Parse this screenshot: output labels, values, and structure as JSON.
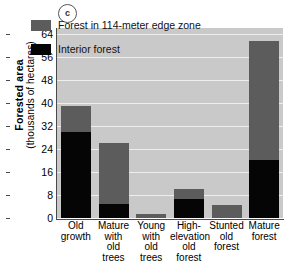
{
  "figure": {
    "panel_label": "c"
  },
  "chart_data": {
    "type": "bar",
    "title": "",
    "subtitle": "",
    "xlabel": "",
    "ylabel": "Forested area",
    "ylabel_units": "(thousands of hectares)",
    "ylim": [
      0,
      66
    ],
    "yticks": [
      0,
      8,
      16,
      24,
      32,
      40,
      48,
      56,
      64
    ],
    "ytick_labels": [
      "0",
      "8",
      "16",
      "24",
      "32",
      "40",
      "48",
      "56",
      "64"
    ],
    "grid": true,
    "grid_axis": "y",
    "stacked": true,
    "legend_position": "inside-top-left",
    "categories": [
      "Old growth",
      "Mature with old trees",
      "Young with old trees",
      "High-elevation old forest",
      "Stunted old forest",
      "Mature forest"
    ],
    "category_lines": [
      [
        "Old",
        "growth"
      ],
      [
        "Mature",
        "with",
        "old",
        "trees"
      ],
      [
        "Young",
        "with",
        "old",
        "trees"
      ],
      [
        "High-",
        "elevation",
        "old",
        "forest"
      ],
      [
        "Stunted",
        "old",
        "forest"
      ],
      [
        "Mature",
        "forest"
      ]
    ],
    "series": [
      {
        "name": "Interior forest",
        "color": "#050505",
        "values": [
          30.0,
          4.7,
          0.0,
          6.5,
          0.0,
          20.0
        ]
      },
      {
        "name": "Forest in 114-meter edge zone",
        "color": "#5c5c5c",
        "values": [
          9.0,
          21.3,
          1.5,
          3.5,
          4.5,
          41.5
        ]
      }
    ],
    "totals": [
      39.0,
      26.0,
      1.5,
      10.0,
      4.5,
      61.5
    ]
  },
  "legend": {
    "items": [
      {
        "label": "Forest in 114-meter edge zone",
        "color": "#5c5c5c"
      },
      {
        "label": "Interior forest",
        "color": "#050505"
      }
    ]
  },
  "colors": {
    "plot_background": "#c9c9c9",
    "gridline": "#eeeeee",
    "axis": "#4a4a4a",
    "page_background": "#ffffff"
  }
}
